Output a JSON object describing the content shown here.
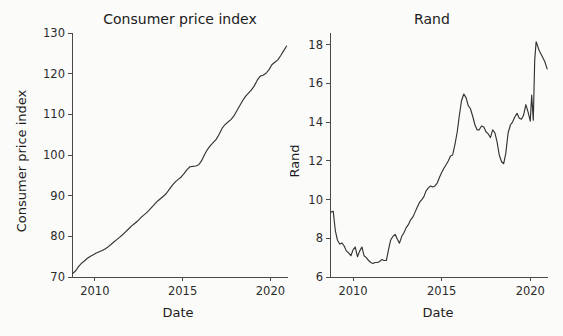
{
  "figure": {
    "background": "#fbfbfa",
    "line_color": "#333333",
    "axis_color": "#4a4a4a",
    "text_color": "#1c1c1c"
  },
  "chart_data": [
    {
      "type": "line",
      "title": "Consumer price index",
      "xlabel": "Date",
      "ylabel": "Consumer price index",
      "xlim": [
        2008.7,
        2021.0
      ],
      "ylim": [
        70,
        130
      ],
      "xticks": [
        2010,
        2015,
        2020
      ],
      "xticklabels": [
        "2010",
        "2015",
        "2020"
      ],
      "yticks": [
        70,
        80,
        90,
        100,
        110,
        120,
        130
      ],
      "yticklabels": [
        "70",
        "80",
        "90",
        "100",
        "110",
        "120",
        "130"
      ],
      "grid": false,
      "legend": false,
      "series": [
        {
          "name": "Consumer price index",
          "x": [
            2008.75,
            2008.92,
            2009.08,
            2009.25,
            2009.42,
            2009.58,
            2009.75,
            2009.92,
            2010.08,
            2010.25,
            2010.42,
            2010.58,
            2010.75,
            2010.92,
            2011.08,
            2011.25,
            2011.42,
            2011.58,
            2011.75,
            2011.92,
            2012.08,
            2012.25,
            2012.42,
            2012.58,
            2012.75,
            2012.92,
            2013.08,
            2013.25,
            2013.42,
            2013.58,
            2013.75,
            2013.92,
            2014.08,
            2014.25,
            2014.42,
            2014.58,
            2014.75,
            2014.92,
            2015.08,
            2015.25,
            2015.42,
            2015.58,
            2015.75,
            2015.92,
            2016.08,
            2016.25,
            2016.42,
            2016.58,
            2016.75,
            2016.92,
            2017.08,
            2017.25,
            2017.42,
            2017.58,
            2017.75,
            2017.92,
            2018.08,
            2018.25,
            2018.42,
            2018.58,
            2018.75,
            2018.92,
            2019.08,
            2019.25,
            2019.42,
            2019.58,
            2019.75,
            2019.92,
            2020.08,
            2020.25,
            2020.42,
            2020.58,
            2020.75,
            2020.92
          ],
          "y": [
            70.9,
            71.6,
            72.6,
            73.4,
            74.0,
            74.6,
            75.1,
            75.5,
            75.9,
            76.2,
            76.5,
            76.9,
            77.4,
            78.0,
            78.6,
            79.2,
            79.8,
            80.4,
            81.1,
            81.8,
            82.5,
            83.1,
            83.7,
            84.4,
            85.1,
            85.7,
            86.4,
            87.2,
            88.0,
            88.7,
            89.3,
            89.9,
            90.6,
            91.6,
            92.6,
            93.4,
            94.0,
            94.6,
            95.4,
            96.4,
            97.1,
            97.2,
            97.3,
            97.6,
            98.6,
            100.1,
            101.4,
            102.3,
            103.1,
            103.9,
            105.1,
            106.6,
            107.5,
            108.1,
            108.7,
            109.6,
            110.8,
            112.1,
            113.4,
            114.4,
            115.2,
            116.0,
            117.0,
            118.4,
            119.4,
            119.6,
            120.1,
            121.0,
            122.2,
            122.8,
            123.4,
            124.4,
            125.6,
            126.8
          ]
        }
      ]
    },
    {
      "type": "line",
      "title": "Rand",
      "xlabel": "Date",
      "ylabel": "Rand",
      "xlim": [
        2008.7,
        2021.0
      ],
      "ylim": [
        6,
        18.6
      ],
      "xticks": [
        2010,
        2015,
        2020
      ],
      "xticklabels": [
        "2010",
        "2015",
        "2020"
      ],
      "yticks": [
        6,
        8,
        10,
        12,
        14,
        16,
        18
      ],
      "yticklabels": [
        "6",
        "8",
        "10",
        "12",
        "14",
        "16",
        "18"
      ],
      "grid": false,
      "legend": false,
      "series": [
        {
          "name": "Rand",
          "x": [
            2008.75,
            2008.88,
            2009.0,
            2009.12,
            2009.25,
            2009.38,
            2009.5,
            2009.62,
            2009.75,
            2009.88,
            2010.0,
            2010.12,
            2010.25,
            2010.38,
            2010.5,
            2010.62,
            2010.75,
            2010.88,
            2011.0,
            2011.12,
            2011.25,
            2011.38,
            2011.5,
            2011.62,
            2011.75,
            2011.88,
            2012.0,
            2012.12,
            2012.25,
            2012.38,
            2012.5,
            2012.62,
            2012.75,
            2012.88,
            2013.0,
            2013.12,
            2013.25,
            2013.38,
            2013.5,
            2013.62,
            2013.75,
            2013.88,
            2014.0,
            2014.12,
            2014.25,
            2014.38,
            2014.5,
            2014.62,
            2014.75,
            2014.88,
            2015.0,
            2015.12,
            2015.25,
            2015.38,
            2015.5,
            2015.62,
            2015.75,
            2015.88,
            2016.0,
            2016.12,
            2016.25,
            2016.38,
            2016.5,
            2016.62,
            2016.75,
            2016.88,
            2017.0,
            2017.12,
            2017.25,
            2017.38,
            2017.5,
            2017.62,
            2017.75,
            2017.88,
            2018.0,
            2018.12,
            2018.25,
            2018.38,
            2018.5,
            2018.62,
            2018.75,
            2018.88,
            2019.0,
            2019.12,
            2019.25,
            2019.38,
            2019.5,
            2019.62,
            2019.75,
            2019.88,
            2020.0,
            2020.08,
            2020.17,
            2020.25,
            2020.33,
            2020.5,
            2020.67,
            2020.83,
            2020.95
          ],
          "y": [
            9.35,
            9.4,
            8.4,
            7.9,
            7.7,
            7.75,
            7.6,
            7.35,
            7.25,
            7.1,
            7.4,
            7.55,
            7.05,
            7.35,
            7.55,
            7.1,
            7.0,
            6.85,
            6.75,
            6.7,
            6.75,
            6.75,
            6.8,
            6.9,
            6.85,
            6.85,
            7.4,
            7.9,
            8.1,
            8.2,
            7.95,
            7.75,
            8.1,
            8.3,
            8.55,
            8.7,
            8.95,
            9.1,
            9.35,
            9.6,
            9.85,
            10.0,
            10.15,
            10.45,
            10.6,
            10.7,
            10.65,
            10.7,
            10.85,
            11.15,
            11.4,
            11.6,
            11.8,
            12.0,
            12.25,
            12.3,
            12.85,
            13.5,
            14.35,
            15.1,
            15.45,
            15.25,
            14.85,
            14.7,
            14.3,
            13.85,
            13.6,
            13.6,
            13.8,
            13.75,
            13.5,
            13.4,
            13.2,
            13.6,
            13.45,
            13.0,
            12.3,
            11.95,
            11.85,
            12.4,
            13.45,
            13.85,
            14.0,
            14.25,
            14.45,
            14.2,
            14.15,
            14.35,
            14.9,
            14.5,
            14.05,
            15.4,
            14.1,
            17.2,
            18.15,
            17.7,
            17.4,
            17.1,
            16.75
          ]
        }
      ]
    }
  ]
}
